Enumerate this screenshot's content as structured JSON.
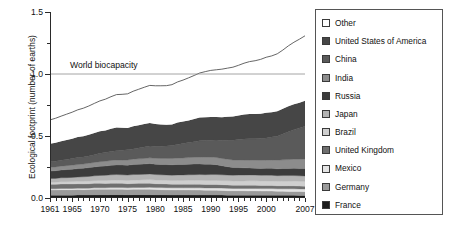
{
  "chart_data": {
    "type": "area",
    "title": "",
    "xlabel": "",
    "ylabel": "Ecological footprint (number of earths)",
    "xlim": [
      1961,
      2007
    ],
    "ylim": [
      0.0,
      1.5
    ],
    "yticks": [
      "0.0",
      "0.5",
      "1.0",
      "1.5"
    ],
    "ytick_values": [
      0.0,
      0.5,
      1.0,
      1.5
    ],
    "xticks": [
      "1961",
      "1965",
      "1970",
      "1975",
      "1980",
      "1985",
      "1990",
      "1995",
      "2000",
      "2007"
    ],
    "xtick_values": [
      1961,
      1965,
      1970,
      1975,
      1980,
      1985,
      1990,
      1995,
      2000,
      2007
    ],
    "grid": false,
    "legend_position": "right",
    "stacked": true,
    "annotations": [
      {
        "text": "World biocapacity",
        "y": 1.0,
        "type": "hline-label"
      }
    ],
    "reference_line": {
      "label": "World biocapacity",
      "value": 1.0
    },
    "x": [
      1961,
      1962,
      1963,
      1964,
      1965,
      1966,
      1967,
      1968,
      1969,
      1970,
      1971,
      1972,
      1973,
      1974,
      1975,
      1976,
      1977,
      1978,
      1979,
      1980,
      1981,
      1982,
      1983,
      1984,
      1985,
      1986,
      1987,
      1988,
      1989,
      1990,
      1991,
      1992,
      1993,
      1994,
      1995,
      1996,
      1997,
      1998,
      1999,
      2000,
      2001,
      2002,
      2003,
      2004,
      2005,
      2006,
      2007
    ],
    "series": [
      {
        "name": "France",
        "color": "#1c1c1c",
        "values": [
          0.022,
          0.022,
          0.023,
          0.023,
          0.023,
          0.024,
          0.024,
          0.024,
          0.025,
          0.025,
          0.025,
          0.026,
          0.026,
          0.026,
          0.025,
          0.026,
          0.026,
          0.026,
          0.026,
          0.025,
          0.025,
          0.025,
          0.024,
          0.024,
          0.024,
          0.024,
          0.024,
          0.024,
          0.024,
          0.024,
          0.024,
          0.024,
          0.023,
          0.023,
          0.023,
          0.023,
          0.023,
          0.023,
          0.023,
          0.023,
          0.023,
          0.022,
          0.022,
          0.022,
          0.022,
          0.021,
          0.021
        ]
      },
      {
        "name": "Germany",
        "color": "#9a9a9a",
        "values": [
          0.043,
          0.043,
          0.044,
          0.044,
          0.044,
          0.044,
          0.043,
          0.044,
          0.045,
          0.045,
          0.045,
          0.045,
          0.045,
          0.044,
          0.043,
          0.044,
          0.044,
          0.044,
          0.044,
          0.043,
          0.042,
          0.041,
          0.041,
          0.041,
          0.041,
          0.041,
          0.04,
          0.04,
          0.039,
          0.039,
          0.038,
          0.037,
          0.036,
          0.035,
          0.035,
          0.035,
          0.034,
          0.034,
          0.033,
          0.033,
          0.033,
          0.032,
          0.032,
          0.031,
          0.031,
          0.031,
          0.03
        ]
      },
      {
        "name": "Mexico",
        "color": "#e4e4e4",
        "values": [
          0.009,
          0.009,
          0.01,
          0.01,
          0.01,
          0.011,
          0.011,
          0.011,
          0.012,
          0.012,
          0.012,
          0.013,
          0.013,
          0.014,
          0.014,
          0.014,
          0.015,
          0.015,
          0.016,
          0.016,
          0.017,
          0.017,
          0.017,
          0.017,
          0.017,
          0.017,
          0.018,
          0.018,
          0.018,
          0.018,
          0.019,
          0.019,
          0.019,
          0.019,
          0.019,
          0.019,
          0.02,
          0.02,
          0.02,
          0.02,
          0.02,
          0.02,
          0.02,
          0.021,
          0.021,
          0.021,
          0.021
        ]
      },
      {
        "name": "United Kingdom",
        "color": "#6f6f6f",
        "values": [
          0.036,
          0.036,
          0.036,
          0.036,
          0.036,
          0.036,
          0.036,
          0.036,
          0.036,
          0.036,
          0.035,
          0.035,
          0.035,
          0.034,
          0.033,
          0.033,
          0.033,
          0.033,
          0.033,
          0.031,
          0.03,
          0.03,
          0.029,
          0.029,
          0.029,
          0.029,
          0.029,
          0.029,
          0.028,
          0.028,
          0.028,
          0.027,
          0.027,
          0.026,
          0.026,
          0.026,
          0.026,
          0.026,
          0.025,
          0.025,
          0.025,
          0.024,
          0.024,
          0.024,
          0.024,
          0.023,
          0.023
        ]
      },
      {
        "name": "Brazil",
        "color": "#cfcfcf",
        "values": [
          0.018,
          0.018,
          0.019,
          0.019,
          0.02,
          0.02,
          0.021,
          0.022,
          0.022,
          0.023,
          0.024,
          0.025,
          0.026,
          0.026,
          0.027,
          0.028,
          0.028,
          0.029,
          0.03,
          0.03,
          0.03,
          0.03,
          0.03,
          0.031,
          0.031,
          0.032,
          0.032,
          0.032,
          0.033,
          0.033,
          0.033,
          0.033,
          0.034,
          0.034,
          0.035,
          0.035,
          0.036,
          0.036,
          0.036,
          0.037,
          0.037,
          0.037,
          0.038,
          0.038,
          0.039,
          0.039,
          0.04
        ]
      },
      {
        "name": "Japan",
        "color": "#b4b4b4",
        "values": [
          0.029,
          0.03,
          0.031,
          0.032,
          0.033,
          0.034,
          0.036,
          0.037,
          0.039,
          0.041,
          0.042,
          0.043,
          0.044,
          0.043,
          0.043,
          0.044,
          0.044,
          0.044,
          0.045,
          0.044,
          0.043,
          0.043,
          0.043,
          0.044,
          0.044,
          0.044,
          0.045,
          0.046,
          0.046,
          0.047,
          0.047,
          0.047,
          0.046,
          0.047,
          0.047,
          0.047,
          0.047,
          0.046,
          0.046,
          0.046,
          0.045,
          0.045,
          0.045,
          0.045,
          0.044,
          0.044,
          0.043
        ]
      },
      {
        "name": "Russia",
        "color": "#3c3c3c",
        "values": [
          0.06,
          0.062,
          0.063,
          0.065,
          0.066,
          0.068,
          0.069,
          0.071,
          0.072,
          0.074,
          0.075,
          0.077,
          0.078,
          0.079,
          0.08,
          0.081,
          0.082,
          0.083,
          0.084,
          0.084,
          0.084,
          0.084,
          0.084,
          0.085,
          0.085,
          0.086,
          0.086,
          0.086,
          0.085,
          0.084,
          0.08,
          0.073,
          0.068,
          0.062,
          0.06,
          0.058,
          0.056,
          0.055,
          0.055,
          0.055,
          0.056,
          0.056,
          0.057,
          0.057,
          0.058,
          0.058,
          0.059
        ]
      },
      {
        "name": "India",
        "color": "#8c8c8c",
        "values": [
          0.03,
          0.031,
          0.031,
          0.032,
          0.033,
          0.033,
          0.034,
          0.035,
          0.036,
          0.037,
          0.038,
          0.039,
          0.04,
          0.041,
          0.042,
          0.043,
          0.044,
          0.045,
          0.046,
          0.047,
          0.048,
          0.049,
          0.05,
          0.051,
          0.052,
          0.053,
          0.054,
          0.055,
          0.056,
          0.057,
          0.058,
          0.059,
          0.06,
          0.061,
          0.062,
          0.063,
          0.064,
          0.065,
          0.066,
          0.067,
          0.068,
          0.069,
          0.07,
          0.072,
          0.074,
          0.076,
          0.078
        ]
      },
      {
        "name": "China",
        "color": "#5a5a5a",
        "values": [
          0.045,
          0.046,
          0.048,
          0.05,
          0.053,
          0.056,
          0.056,
          0.058,
          0.062,
          0.067,
          0.07,
          0.072,
          0.075,
          0.078,
          0.082,
          0.083,
          0.087,
          0.092,
          0.095,
          0.097,
          0.098,
          0.101,
          0.105,
          0.11,
          0.116,
          0.121,
          0.126,
          0.131,
          0.134,
          0.136,
          0.14,
          0.145,
          0.152,
          0.158,
          0.165,
          0.17,
          0.172,
          0.173,
          0.175,
          0.178,
          0.184,
          0.193,
          0.208,
          0.224,
          0.238,
          0.252,
          0.264
        ]
      },
      {
        "name": "United States of America",
        "color": "#464646",
        "values": [
          0.145,
          0.148,
          0.152,
          0.156,
          0.16,
          0.165,
          0.168,
          0.172,
          0.176,
          0.178,
          0.179,
          0.183,
          0.186,
          0.181,
          0.176,
          0.182,
          0.184,
          0.185,
          0.186,
          0.18,
          0.176,
          0.17,
          0.17,
          0.176,
          0.177,
          0.179,
          0.183,
          0.188,
          0.189,
          0.188,
          0.186,
          0.188,
          0.19,
          0.192,
          0.193,
          0.197,
          0.199,
          0.199,
          0.201,
          0.204,
          0.2,
          0.202,
          0.203,
          0.206,
          0.206,
          0.204,
          0.205
        ]
      },
      {
        "name": "Other",
        "color": "#ffffff",
        "values": [
          0.193,
          0.198,
          0.203,
          0.209,
          0.214,
          0.22,
          0.226,
          0.232,
          0.238,
          0.245,
          0.252,
          0.259,
          0.266,
          0.27,
          0.275,
          0.283,
          0.29,
          0.297,
          0.303,
          0.308,
          0.312,
          0.316,
          0.321,
          0.328,
          0.335,
          0.343,
          0.351,
          0.359,
          0.367,
          0.375,
          0.381,
          0.387,
          0.392,
          0.398,
          0.405,
          0.414,
          0.423,
          0.43,
          0.438,
          0.447,
          0.455,
          0.463,
          0.474,
          0.487,
          0.499,
          0.512,
          0.524
        ]
      }
    ],
    "total_line": {
      "name": "Total ecological footprint",
      "values": [
        0.63,
        0.643,
        0.66,
        0.676,
        0.692,
        0.711,
        0.724,
        0.742,
        0.763,
        0.783,
        0.797,
        0.817,
        0.834,
        0.836,
        0.84,
        0.861,
        0.877,
        0.893,
        0.908,
        0.905,
        0.905,
        0.906,
        0.914,
        0.936,
        0.951,
        0.969,
        0.988,
        1.008,
        1.019,
        1.029,
        1.034,
        1.039,
        1.047,
        1.055,
        1.07,
        1.087,
        1.1,
        1.107,
        1.118,
        1.135,
        1.146,
        1.163,
        1.193,
        1.227,
        1.256,
        1.281,
        1.308
      ]
    }
  },
  "legend": {
    "items": [
      {
        "label": "Other",
        "color": "#ffffff"
      },
      {
        "label": "United States of America",
        "color": "#464646"
      },
      {
        "label": "China",
        "color": "#5a5a5a"
      },
      {
        "label": "India",
        "color": "#8c8c8c"
      },
      {
        "label": "Russia",
        "color": "#3c3c3c"
      },
      {
        "label": "Japan",
        "color": "#b4b4b4"
      },
      {
        "label": "Brazil",
        "color": "#cfcfcf"
      },
      {
        "label": "United Kingdom",
        "color": "#6f6f6f"
      },
      {
        "label": "Mexico",
        "color": "#e4e4e4"
      },
      {
        "label": "Germany",
        "color": "#9a9a9a"
      },
      {
        "label": "France",
        "color": "#1c1c1c"
      }
    ]
  }
}
